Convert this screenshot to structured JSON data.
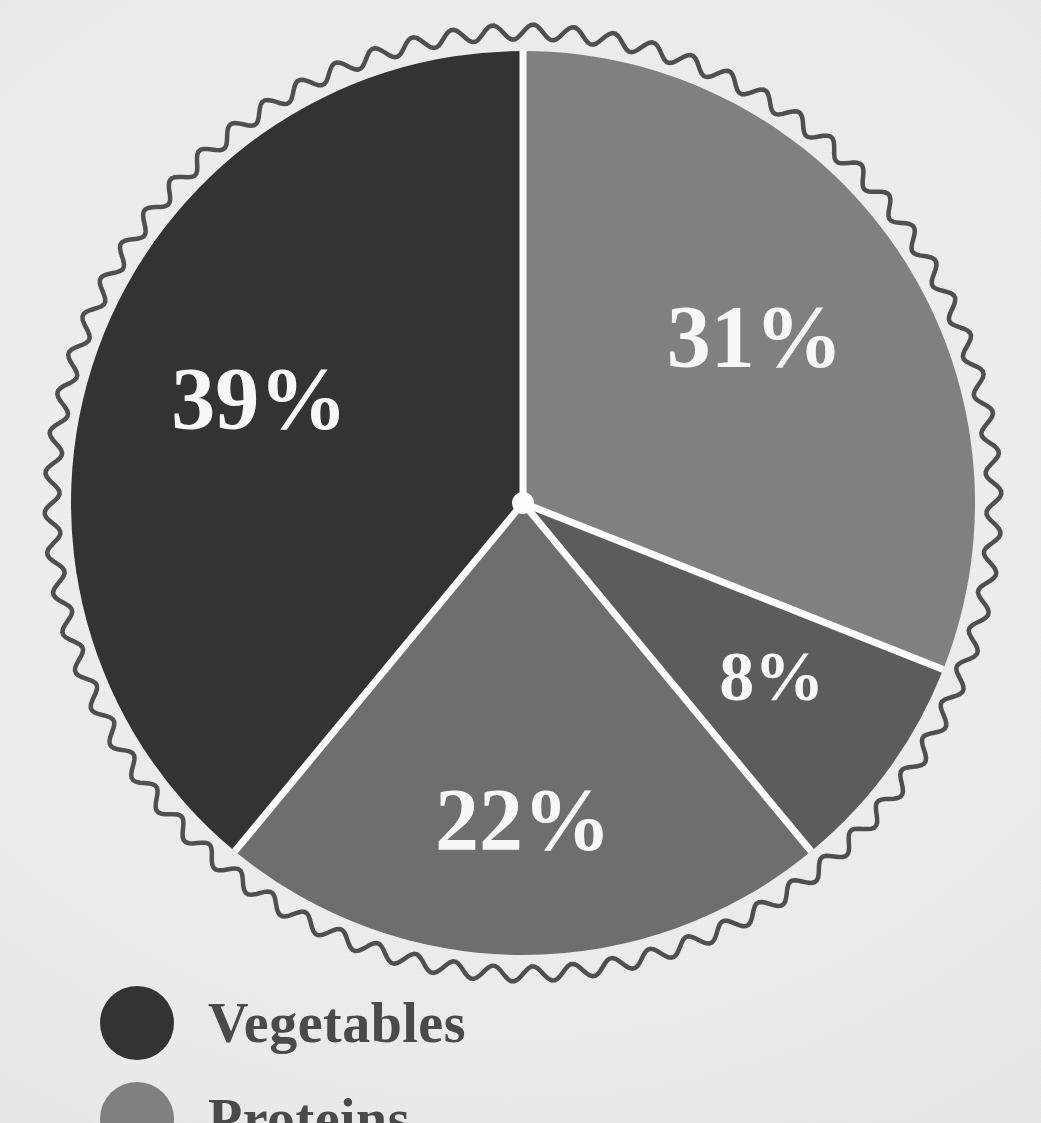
{
  "background_color": "#eeeeec",
  "chart_data": {
    "type": "pie",
    "title": "",
    "labels": [
      "Vegetables",
      "Proteins",
      "Grains",
      "Fruits"
    ],
    "values": [
      39,
      31,
      22,
      8
    ],
    "value_labels": [
      "39%",
      "31%",
      "22%",
      "8%"
    ],
    "colors": [
      "#333333",
      "#808080",
      "#6e6e6e",
      "#5c5c5c"
    ],
    "legend_position": "bottom-left",
    "slice_separator_color": "#fdfdfb",
    "label_text_color": "#f7f7f5",
    "start_angle_deg": 0,
    "direction": "clockwise",
    "slices": [
      {
        "name": "vegetables",
        "label": "39%",
        "percent": 39,
        "color": "#333333",
        "start_deg": 219.6,
        "end_deg": 360.0
      },
      {
        "name": "proteins",
        "label": "31%",
        "percent": 31,
        "color": "#808080",
        "start_deg": 0.0,
        "end_deg": 111.6
      },
      {
        "name": "fruits",
        "label": "8%",
        "percent": 8,
        "color": "#5c5c5c",
        "start_deg": 111.6,
        "end_deg": 140.4
      },
      {
        "name": "grains",
        "label": "22%",
        "percent": 22,
        "color": "#6e6e6e",
        "start_deg": 140.4,
        "end_deg": 219.6
      }
    ]
  },
  "pie": {
    "center_x": 523,
    "center_y": 503,
    "radius": 452,
    "label_39": "39%",
    "label_31": "31%",
    "label_22": "22%",
    "label_8": "8%"
  },
  "decoration": {
    "ring_style": "wavy-scallop",
    "ring_color": "#4f4f4f",
    "ring_radius": 471
  },
  "legend": {
    "items": [
      {
        "label": "Vegetables",
        "color": "#333333",
        "icon": "legend-dot-icon"
      },
      {
        "label": "Proteins",
        "color": "#808080",
        "icon": "legend-dot-icon"
      }
    ]
  }
}
